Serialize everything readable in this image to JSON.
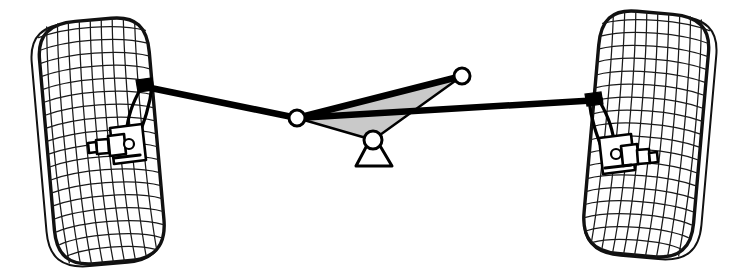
{
  "diagram": {
    "type": "mechanical-wireframe-diagram",
    "background_color": "#ffffff",
    "stroke_color": "#000000",
    "fill_gray": "#c9c9c9",
    "canvas": {
      "width": 749,
      "height": 277
    },
    "components": [
      {
        "name": "left-wheel",
        "label": "Left Wheel",
        "kind": "wireframe-tire"
      },
      {
        "name": "right-wheel",
        "label": "Right Wheel",
        "kind": "wireframe-tire"
      },
      {
        "name": "left-steering-knuckle",
        "label": "Left Steering Knuckle",
        "kind": "knuckle"
      },
      {
        "name": "right-steering-knuckle",
        "label": "Right Steering Knuckle",
        "kind": "knuckle"
      },
      {
        "name": "left-tie-rod",
        "label": "Left Tie Rod",
        "kind": "link"
      },
      {
        "name": "right-tie-rod",
        "label": "Right Tie Rod",
        "kind": "link"
      },
      {
        "name": "bellcrank",
        "label": "Bellcrank / Idler Arm",
        "kind": "triangular-plate"
      },
      {
        "name": "ground-pivot",
        "label": "Ground Pivot Mount",
        "kind": "support"
      }
    ],
    "joints": [
      {
        "name": "left-outer-joint",
        "label": "Left Outer Ball Joint",
        "cx": 140,
        "cy": 86,
        "r": 5
      },
      {
        "name": "bellcrank-left-joint",
        "label": "Bellcrank Left Joint",
        "cx": 297,
        "cy": 118,
        "r": 8
      },
      {
        "name": "bellcrank-upper-joint",
        "label": "Bellcrank Upper Joint",
        "cx": 462,
        "cy": 76,
        "r": 8
      },
      {
        "name": "bellcrank-pivot-joint",
        "label": "Bellcrank Center Pivot",
        "cx": 373,
        "cy": 140,
        "r": 9
      },
      {
        "name": "right-outer-joint",
        "label": "Right Outer Ball Joint",
        "cx": 600,
        "cy": 100,
        "r": 5
      }
    ],
    "left_wheel": {
      "center_x": 97,
      "center_y": 143,
      "half_width": 58,
      "half_height": 122,
      "tilt_deg": -5,
      "mesh_rings": 19,
      "mesh_radials": 11
    },
    "right_wheel": {
      "center_x": 651,
      "center_y": 136,
      "half_width": 60,
      "half_height": 122,
      "tilt_deg": 5,
      "mesh_rings": 19,
      "mesh_radials": 11
    }
  }
}
